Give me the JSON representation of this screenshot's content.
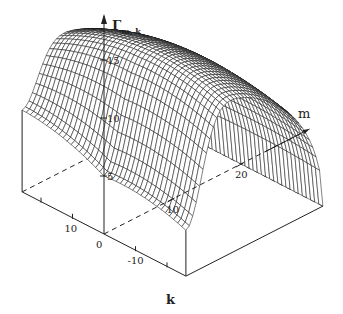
{
  "chart_data": {
    "type": "surface",
    "title": "",
    "zlabel": "Γ",
    "zlabel_subscript": "m, k",
    "xlabel": "k",
    "ylabel": "m",
    "xlim": [
      -26,
      26
    ],
    "ylim": [
      0,
      20
    ],
    "zlim": [
      0,
      15
    ],
    "x_ticks": [
      {
        "value": 10,
        "label": "10"
      },
      {
        "value": 0,
        "label": "0"
      },
      {
        "value": -10,
        "label": "-10"
      }
    ],
    "y_ticks": [
      {
        "value": 10,
        "label": "10"
      },
      {
        "value": 20,
        "label": "20"
      }
    ],
    "z_ticks": [
      {
        "value": 5,
        "label": "5"
      },
      {
        "value": 10,
        "label": "10"
      },
      {
        "value": 15,
        "label": "15"
      }
    ],
    "grid_k": [
      -26,
      -22,
      -18,
      -14,
      -10,
      -6,
      -2,
      2,
      6,
      10,
      14,
      18,
      22,
      26
    ],
    "grid_m": [
      0,
      1,
      2,
      3,
      4,
      5,
      6,
      7,
      8,
      9,
      10,
      11,
      12,
      13,
      14,
      15,
      16,
      17,
      18,
      19,
      20
    ],
    "surface_model": "ridge along m: Γ≈15 near m≈4, drops to 0 at m=20; dips to ≈5 at m=0 for k≤0, ≈10 at m=0,k=26",
    "key_values": [
      {
        "m": 0,
        "k": 0,
        "gamma": 5
      },
      {
        "m": 0,
        "k": 26,
        "gamma": 9.6
      },
      {
        "m": 0,
        "k": -26,
        "gamma": 5
      },
      {
        "m": 12,
        "k": -26,
        "gamma": 11
      },
      {
        "m": 20,
        "k": -26,
        "gamma": 0
      },
      {
        "m": 4,
        "k": 8,
        "gamma": 15
      }
    ]
  }
}
